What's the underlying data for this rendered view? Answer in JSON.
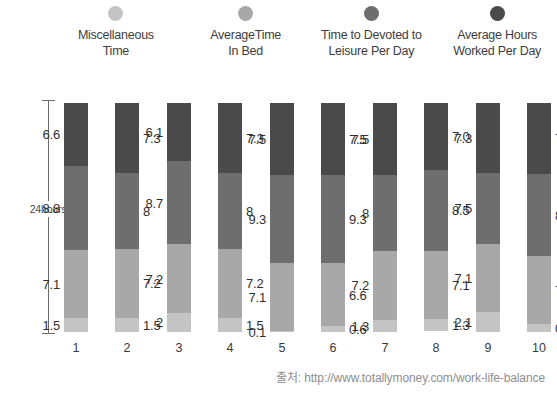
{
  "legend": {
    "items": [
      {
        "label": "Miscellaneous\nTime",
        "color": "#c4c4c4",
        "icon": "legend-dot-icon"
      },
      {
        "label": "AverageTime\nIn Bed",
        "color": "#a8a8a8",
        "icon": "legend-dot-icon"
      },
      {
        "label": "Time to Devoted to\nLeisure Per Day",
        "color": "#6e6e6e",
        "icon": "legend-dot-icon"
      },
      {
        "label": "Average Hours\nWorked Per Day",
        "color": "#4a4a4a",
        "icon": "legend-dot-icon"
      }
    ]
  },
  "axis": {
    "label": "24hours"
  },
  "source": {
    "text": "출처: http://www.totallymoney.com/work-life-balance"
  },
  "chart_data": {
    "type": "bar",
    "subtype": "stacked-bar",
    "title": "",
    "xlabel": "",
    "ylabel": "24hours",
    "ylim": [
      0,
      24
    ],
    "grid": false,
    "legend_position": "top",
    "categories": [
      "1",
      "2",
      "3",
      "4",
      "5",
      "6",
      "7",
      "8",
      "9",
      "10"
    ],
    "series": [
      {
        "name": "Miscellaneous Time",
        "color": "#c4c4c4",
        "values": [
          1.5,
          1.5,
          2,
          1.5,
          0.1,
          0.6,
          1.3,
          1.3,
          2.1,
          0.8
        ]
      },
      {
        "name": "Time to Devoted to Leisure Per Day",
        "color": "#a8a8a8",
        "values": [
          7.1,
          7.2,
          7.2,
          7.2,
          7.1,
          6.6,
          7.2,
          7.1,
          7.1,
          7.2
        ]
      },
      {
        "name": "Average Time In Bed",
        "color": "#6e6e6e",
        "values": [
          8.8,
          8,
          8.7,
          8,
          9.3,
          9.3,
          8,
          8.5,
          7.5,
          8.6
        ]
      },
      {
        "name": "Average Hours Worked Per Day",
        "color": "#4a4a4a",
        "values": [
          6.6,
          7.3,
          6.1,
          7.3,
          7.5,
          7.5,
          7.5,
          7.0,
          7.3,
          7.4
        ]
      }
    ],
    "value_labels": {
      "1": {
        "misc": "1.5",
        "leisure": "7.1",
        "bed": "8.8",
        "work": "6.6",
        "side": "left"
      },
      "2": {
        "misc": "1.5",
        "leisure": "7.2",
        "bed": "8",
        "work": "7.3",
        "side": "right"
      },
      "3": {
        "misc": "2",
        "leisure": "7.2",
        "bed": "8.7",
        "work": "6.1",
        "side": "left"
      },
      "4": {
        "misc": "1.5",
        "leisure": "7.2",
        "bed": "8",
        "work": "7.3",
        "side": "right"
      },
      "5": {
        "misc": "0.1",
        "leisure": "7.1",
        "bed": "9.3",
        "work": "7.5",
        "side": "left"
      },
      "6": {
        "misc": "0.6",
        "leisure": "6.6",
        "bed": "9.3",
        "work": "7.5",
        "side": "right"
      },
      "7": {
        "misc": "1.3",
        "leisure": "7.2",
        "bed": "8",
        "work": "7.5",
        "side": "left"
      },
      "8": {
        "misc": "1.3",
        "leisure": "7.1",
        "bed": "8.5",
        "work": "7.0",
        "side": "right"
      },
      "9": {
        "misc": "2.1",
        "leisure": "7.1",
        "bed": "7.5",
        "work": "7.3",
        "side": "left"
      },
      "10": {
        "misc": "0.8",
        "leisure": "7.2",
        "bed": "8.6",
        "work": "7.4",
        "side": "right"
      }
    }
  }
}
